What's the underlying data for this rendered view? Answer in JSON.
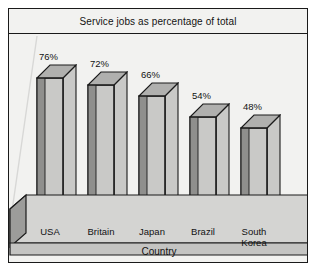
{
  "chart_data": {
    "type": "bar",
    "title": "Service jobs as percentage of total",
    "xlabel": "Country",
    "ylabel": "",
    "categories": [
      "USA",
      "Britain",
      "Japan",
      "Brazil",
      "South\nKorea"
    ],
    "values": [
      76,
      72,
      66,
      54,
      48
    ],
    "value_labels": [
      "76%",
      "72%",
      "66%",
      "54%",
      "48%"
    ],
    "ylim": [
      0,
      85
    ],
    "grid": false,
    "legend": false,
    "style": "3d-bar",
    "colors": {
      "bar_front": "#c9c9c7",
      "bar_side": "#8f8f8d",
      "bar_top": "#b0b0ae",
      "bar_outline": "#1a1a1a",
      "plot_background": "#f2f2f0",
      "floor_top": "#d3d3d1",
      "floor_front": "#c2c2c0",
      "floor_side": "#9a9a98",
      "frame_border": "#1a1a1a",
      "text": "#121212"
    }
  },
  "icons": {
    "bar_3d": "bar-3d-icon"
  }
}
